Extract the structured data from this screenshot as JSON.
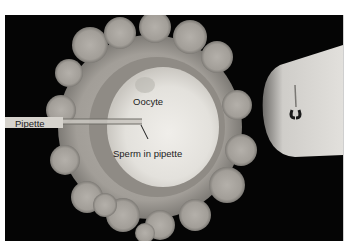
{
  "figure": {
    "type": "micrograph",
    "labels": {
      "oocyte": "Oocyte",
      "pipette": "Pipette",
      "sperm": "Sperm in pipette"
    },
    "colors": {
      "background": "#050505",
      "page": "#ffffff",
      "cumulus": "#a8a49e",
      "zona": "#8e8a84",
      "oocyte": "#e6e4df",
      "label_bar": "#d6d3cd",
      "text": "#1c1c1c"
    }
  }
}
